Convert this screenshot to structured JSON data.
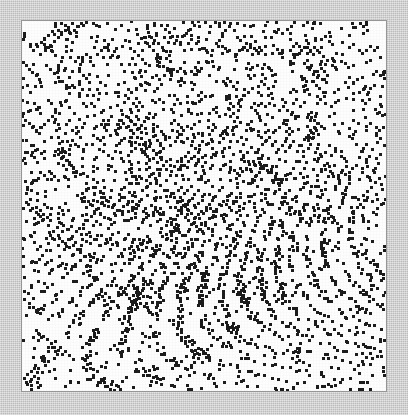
{
  "figure": {
    "title": "",
    "width": 408,
    "height": 415,
    "background_color": "#c9c9c9",
    "panel_background_color": "#fdfdfd",
    "panel_border_color": "#969696",
    "panel": {
      "left": 22,
      "top": 21,
      "width": 364,
      "height": 370
    }
  },
  "chart_data": {
    "type": "scatter",
    "title": "",
    "subtitle": "",
    "xlabel": "",
    "ylabel": "",
    "xlim": [
      0,
      364
    ],
    "ylim": [
      0,
      370
    ],
    "xticks": [],
    "yticks": [],
    "xticklabels": [],
    "yticklabels": [],
    "grid": false,
    "legend": false,
    "legend_position": "none",
    "annotations": [],
    "marker": {
      "shape": "square",
      "color": "#1c1c1c",
      "size_px": 3,
      "edge_color": "#1c1c1c",
      "alpha": 1.0
    },
    "series": [
      {
        "name": "points",
        "color": "#1c1c1c",
        "n_points": 3000,
        "description": "dense modular lattice point pattern with diagonal alignments and a denser cluster near the center",
        "generator": {
          "kind": "modular-lattice",
          "grid_cols": 104,
          "grid_rows": 106,
          "cell_px": 3.5,
          "modulus": 211,
          "multiplier": 97,
          "threshold": 0.52,
          "center_boost": 0.22,
          "center_sigma": 0.26,
          "seed": 20240917
        }
      }
    ]
  }
}
